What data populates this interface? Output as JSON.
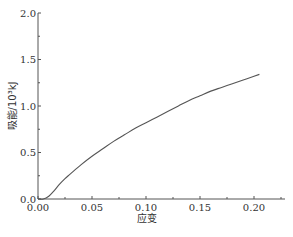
{
  "chart_data": {
    "type": "line",
    "title": "",
    "xlabel": "应变",
    "ylabel": "吸能/10³kJ",
    "xlim": [
      0,
      0.225
    ],
    "ylim": [
      0,
      2.0
    ],
    "x_ticks": [
      "0.00",
      "0.05",
      "0.10",
      "0.15",
      "0.20"
    ],
    "y_ticks": [
      "0.0",
      "0.5",
      "1.0",
      "1.5",
      "2.0"
    ],
    "grid": false,
    "legend": null,
    "series": [
      {
        "name": "吸能",
        "color": "#555555",
        "x": [
          0.0,
          0.005,
          0.01,
          0.015,
          0.02,
          0.025,
          0.03,
          0.04,
          0.05,
          0.06,
          0.07,
          0.08,
          0.09,
          0.1,
          0.11,
          0.12,
          0.13,
          0.14,
          0.15,
          0.16,
          0.17,
          0.18,
          0.19,
          0.2,
          0.205
        ],
        "y": [
          0.0,
          0.0,
          0.03,
          0.09,
          0.16,
          0.22,
          0.27,
          0.37,
          0.46,
          0.54,
          0.62,
          0.69,
          0.76,
          0.82,
          0.88,
          0.94,
          1.0,
          1.06,
          1.11,
          1.16,
          1.2,
          1.24,
          1.28,
          1.32,
          1.34
        ]
      }
    ]
  }
}
